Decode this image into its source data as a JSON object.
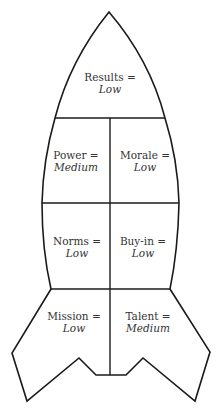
{
  "diagram": {
    "type": "rocket",
    "stroke_color": "#1a1a1a",
    "text_color": "#333333",
    "sections": [
      {
        "id": "results",
        "name": "Results =",
        "value": "Low"
      },
      {
        "id": "power",
        "name": "Power =",
        "value": "Medium"
      },
      {
        "id": "morale",
        "name": "Morale =",
        "value": "Low"
      },
      {
        "id": "norms",
        "name": "Norms =",
        "value": "Low"
      },
      {
        "id": "buy-in",
        "name": "Buy-in =",
        "value": "Low"
      },
      {
        "id": "mission",
        "name": "Mission =",
        "value": "Low"
      },
      {
        "id": "talent",
        "name": "Talent =",
        "value": "Medium"
      }
    ]
  }
}
